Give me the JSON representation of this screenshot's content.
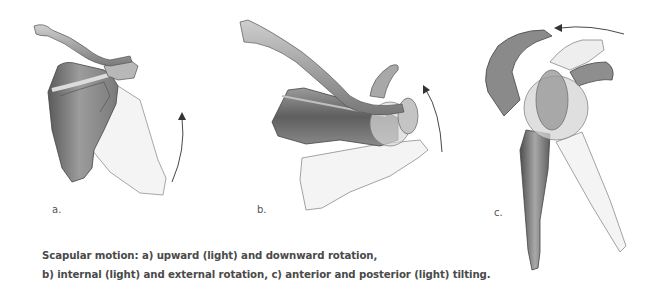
{
  "figure": {
    "panels": [
      {
        "id": "a",
        "label": "a.",
        "motion": "upward (light) and downward rotation",
        "arrow": "curved-up"
      },
      {
        "id": "b",
        "label": "b.",
        "motion": "internal (light) and external rotation",
        "arrow": "curved-up"
      },
      {
        "id": "c",
        "label": "c.",
        "motion": "anterior and posterior (light) tilting",
        "arrow": "curved-left"
      }
    ],
    "caption": {
      "line1": "Scapular motion: a) upward (light) and downward rotation,",
      "line2": "b) internal (light) and external rotation, c) anterior and posterior (light) tilting."
    }
  },
  "colors": {
    "bone_dark": "#6e6e6e",
    "bone_mid": "#9a9a9a",
    "bone_light": "#c8c8c8",
    "ghost_fill": "#f2f2f2",
    "ghost_stroke": "#9a9a9a",
    "text": "#4a4a4a"
  }
}
